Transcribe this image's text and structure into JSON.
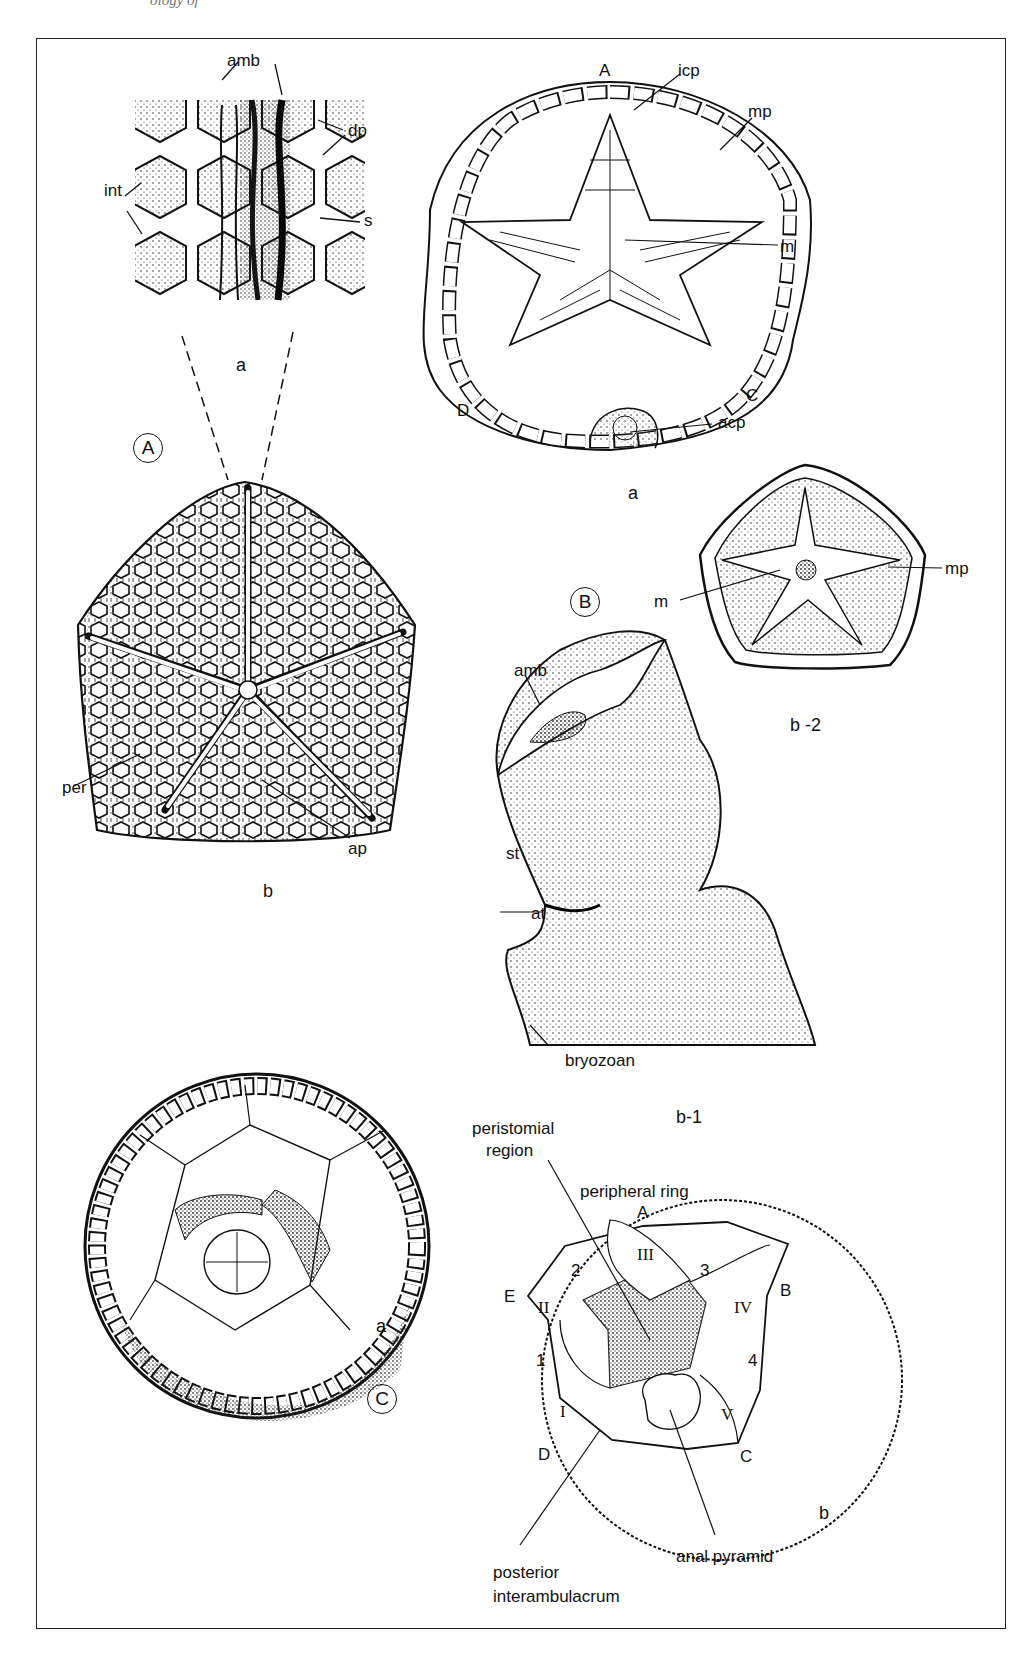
{
  "page": {
    "running_header_fragment": "ology of",
    "figure_sections": [
      {
        "id": "A",
        "panels": [
          {
            "id": "a",
            "label": "a",
            "labels": [
              "amb",
              "dp",
              "int",
              "s"
            ]
          },
          {
            "id": "b",
            "label": "b",
            "labels": [
              "per",
              "ap"
            ]
          }
        ]
      },
      {
        "id": "B",
        "panels": [
          {
            "id": "a",
            "label": "a",
            "labels": [
              "A",
              "icp",
              "mp",
              "m",
              "C",
              "D",
              "acp"
            ]
          },
          {
            "id": "b-2",
            "label": "b -2",
            "labels": [
              "m",
              "mp"
            ]
          },
          {
            "id": "b-1",
            "label": "b-1",
            "labels": [
              "amb",
              "st",
              "at",
              "bryozoan"
            ]
          }
        ]
      },
      {
        "id": "C",
        "panels": [
          {
            "id": "a",
            "label": "a",
            "labels": []
          },
          {
            "id": "b",
            "label": "b",
            "labels": [
              "peristomial region",
              "peripheral ring",
              "A",
              "B",
              "C",
              "D",
              "E",
              "I",
              "II",
              "III",
              "IV",
              "V",
              "1",
              "2",
              "3",
              "4",
              "anal pyramid",
              "posterior interambulacrum"
            ]
          }
        ]
      }
    ]
  },
  "labels": {
    "A_a_amb": "amb",
    "A_a_dp": "dp",
    "A_a_int": "int",
    "A_a_s": "s",
    "A_a_panel": "a",
    "A_section": "A",
    "A_b_per": "per",
    "A_b_ap": "ap",
    "A_b_panel": "b",
    "B_a_A": "A",
    "B_a_icp": "icp",
    "B_a_mp": "mp",
    "B_a_m": "m",
    "B_a_C": "C",
    "B_a_D": "D",
    "B_a_acp": "acp",
    "B_a_panel": "a",
    "B_section": "B",
    "B_b2_m": "m",
    "B_b2_mp": "mp",
    "B_b2_panel": "b -2",
    "B_b1_amb": "amb",
    "B_b1_st": "st",
    "B_b1_at": "at",
    "B_b1_bryozoan": "bryozoan",
    "B_b1_panel": "b-1",
    "C_a_panel": "a",
    "C_section": "C",
    "C_b_peristomial_1": "peristomial",
    "C_b_peristomial_2": "region",
    "C_b_peripheral_ring": "peripheral ring",
    "C_b_A": "A",
    "C_b_B": "B",
    "C_b_C": "C",
    "C_b_D": "D",
    "C_b_E": "E",
    "C_b_I": "I",
    "C_b_II": "II",
    "C_b_III": "III",
    "C_b_IV": "IV",
    "C_b_V": "V",
    "C_b_1": "1",
    "C_b_2": "2",
    "C_b_3": "3",
    "C_b_4": "4",
    "C_b_anal": "anal pyramid",
    "C_b_post_1": "posterior",
    "C_b_post_2": "interambulacrum",
    "C_b_panel": "b"
  }
}
